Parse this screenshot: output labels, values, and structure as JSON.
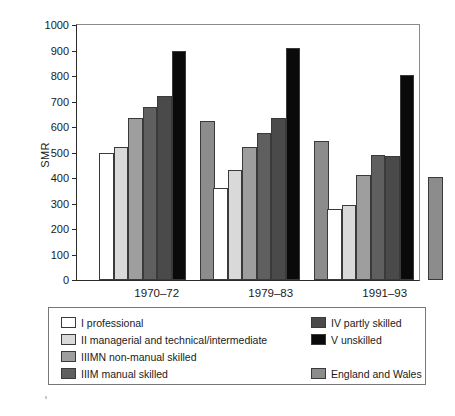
{
  "chart_data": {
    "type": "bar",
    "title": "",
    "subtitle": "",
    "xlabel": "",
    "ylabel": "SMR",
    "categories": [
      "1970–72",
      "1979–83",
      "1991–93"
    ],
    "ylim": [
      0,
      1000
    ],
    "ytick_step": 100,
    "yticks": [
      0,
      100,
      200,
      300,
      400,
      500,
      600,
      700,
      800,
      900,
      1000
    ],
    "ytick_labels": [
      "0",
      "100",
      "200",
      "300",
      "400",
      "500",
      "600",
      "700",
      "800",
      "900",
      "1000"
    ],
    "grid": false,
    "legend_position": "below-plot",
    "series": [
      {
        "name": "I professional",
        "key": "I",
        "color": "#ffffff",
        "values": [
          500,
          360,
          280
        ]
      },
      {
        "name": "II managerial and technical/intermediate",
        "key": "II",
        "color": "#d9d9d9",
        "values": [
          520,
          432,
          296
        ]
      },
      {
        "name": "IIIMN non-manual skilled",
        "key": "IIIMN",
        "color": "#9e9e9e",
        "values": [
          635,
          523,
          410
        ]
      },
      {
        "name": "IIIM manual skilled",
        "key": "IIIM",
        "color": "#5f5f5f",
        "values": [
          677,
          575,
          492
        ]
      },
      {
        "name": "IV partly skilled",
        "key": "IV",
        "color": "#4a4a4a",
        "values": [
          722,
          637,
          487
        ]
      },
      {
        "name": "V unskilled",
        "key": "V",
        "color": "#0a0a0a",
        "values": [
          898,
          910,
          803
        ]
      },
      {
        "name": "England and Wales",
        "key": "EW",
        "color": "#8c8c8c",
        "values": [
          625,
          545,
          403
        ]
      }
    ]
  },
  "legend": {
    "left_column": [
      {
        "label": "I professional",
        "color": "#ffffff"
      },
      {
        "label": "II managerial and technical/intermediate",
        "color": "#d9d9d9"
      },
      {
        "label": "IIIMN non-manual skilled",
        "color": "#9e9e9e"
      },
      {
        "label": "IIIM manual skilled",
        "color": "#5f5f5f"
      }
    ],
    "right_column": [
      {
        "label": "IV partly skilled",
        "color": "#4a4a4a"
      },
      {
        "label": "V unskilled",
        "color": "#0a0a0a"
      },
      {
        "label": "England and Wales",
        "color": "#8c8c8c"
      }
    ]
  },
  "colors": {
    "axis": "#2b2b2b",
    "frame": "#8a8a8a",
    "bar_outline": "#3a3a3a",
    "background": "#ffffff",
    "text": "#1a1a1a"
  }
}
